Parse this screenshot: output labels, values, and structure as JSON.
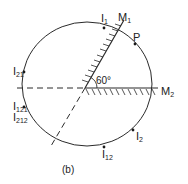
{
  "figure": {
    "caption": "(b)",
    "angle_label": "60°",
    "mirrors": [
      {
        "id": "M1",
        "label": "M",
        "sub": "1"
      },
      {
        "id": "M2",
        "label": "M",
        "sub": "2"
      }
    ],
    "points": [
      {
        "id": "P",
        "label": "P",
        "sub": ""
      },
      {
        "id": "I1",
        "label": "I",
        "sub": "1"
      },
      {
        "id": "I2",
        "label": "I",
        "sub": "2"
      },
      {
        "id": "I21",
        "label": "I",
        "sub": "21"
      },
      {
        "id": "I12",
        "label": "I",
        "sub": "12"
      },
      {
        "id": "I121",
        "label": "I",
        "sub": "121"
      },
      {
        "id": "I212",
        "label": "I",
        "sub": "212"
      }
    ]
  },
  "colors": {
    "line": "#2a2a2a",
    "background": "#ffffff"
  }
}
